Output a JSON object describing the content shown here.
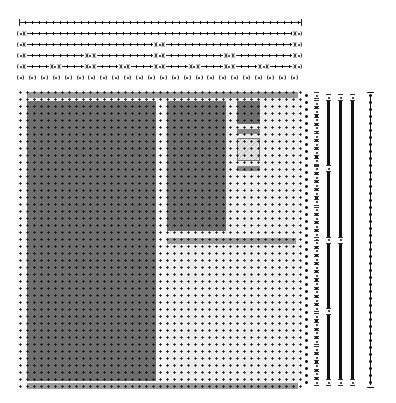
{
  "diagram": {
    "type": "layout-grid-visualization",
    "grid_step_px": 7,
    "colors": {
      "background": "#ffffff",
      "panel_light": "#eeeeee",
      "panel_dark": "#6e6e6e",
      "strip": "#9a9a9a",
      "hatched": "#dcdcdc",
      "dot": "#111111",
      "line": "#222222"
    },
    "horizontal_rulers": [
      {
        "row": 1,
        "segments": 1,
        "style": "full-span"
      },
      {
        "row": 2,
        "segments": 1,
        "style": "separated"
      },
      {
        "row": 3,
        "segments": 2,
        "style": "separated"
      },
      {
        "row": 4,
        "segments": 4,
        "style": "separated"
      },
      {
        "row": 5,
        "segments": 8,
        "style": "separated"
      },
      {
        "row": 6,
        "segments": 24,
        "style": "cells-only"
      }
    ],
    "vertical_rulers": [
      {
        "col": 1,
        "style": "cells-only"
      },
      {
        "col": 2,
        "segments": 8,
        "style": "separated"
      },
      {
        "col": 3,
        "segments": 4,
        "style": "separated"
      },
      {
        "col": 4,
        "segments": 2,
        "style": "separated"
      },
      {
        "col": 5,
        "segments": 1,
        "style": "separated"
      },
      {
        "col": 6,
        "segments": 1,
        "style": "full-span"
      }
    ],
    "regions": [
      {
        "name": "top-strip",
        "shade": "strip"
      },
      {
        "name": "left-panel",
        "shade": "dark"
      },
      {
        "name": "middle-panel",
        "shade": "dark"
      },
      {
        "name": "small-square",
        "shade": "dark"
      },
      {
        "name": "small-strip-1",
        "shade": "strip"
      },
      {
        "name": "hatched-square",
        "shade": "hatched"
      },
      {
        "name": "small-strip-2",
        "shade": "strip"
      },
      {
        "name": "wide-strip",
        "shade": "strip"
      },
      {
        "name": "right-panel",
        "shade": "light"
      },
      {
        "name": "bottom-strip",
        "shade": "strip"
      }
    ]
  }
}
